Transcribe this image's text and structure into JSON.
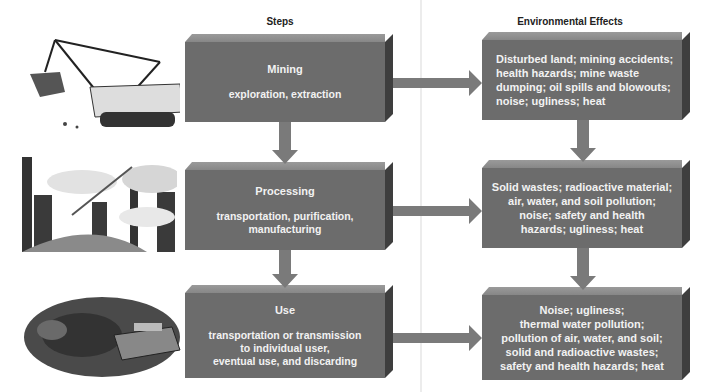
{
  "headers": {
    "steps": "Steps",
    "effects": "Environmental Effects"
  },
  "steps": [
    {
      "title": "Mining",
      "desc": "exploration, extraction",
      "illustration": "power-shovel-excavator"
    },
    {
      "title": "Processing",
      "desc": "transportation, purification, manufacturing",
      "illustration": "industrial-smokestacks"
    },
    {
      "title": "Use",
      "desc_lines": [
        "transportation or transmission",
        "to individual user,",
        "eventual use, and discarding"
      ],
      "illustration": "junkyard-cars"
    }
  ],
  "effects": [
    {
      "lines": [
        "Disturbed land; mining accidents;",
        "health hazards; mine waste",
        "dumping; oil spills and blowouts;",
        "noise; ugliness; heat"
      ]
    },
    {
      "lines": [
        "Solid wastes; radioactive material;",
        "air, water, and soil pollution;",
        "noise; safety and health",
        "hazards; ugliness; heat"
      ]
    },
    {
      "lines": [
        "Noise; ugliness;",
        "thermal water pollution;",
        "pollution of air, water, and soil;",
        "solid and radioactive wastes;",
        "safety and health hazards; heat"
      ]
    }
  ],
  "colors": {
    "box_face": "#6c6c6c",
    "box_top": "#8f8f8f",
    "box_side": "#3e3e3e",
    "arrow": "#7a7a7a",
    "text": "#f2f2f2"
  }
}
